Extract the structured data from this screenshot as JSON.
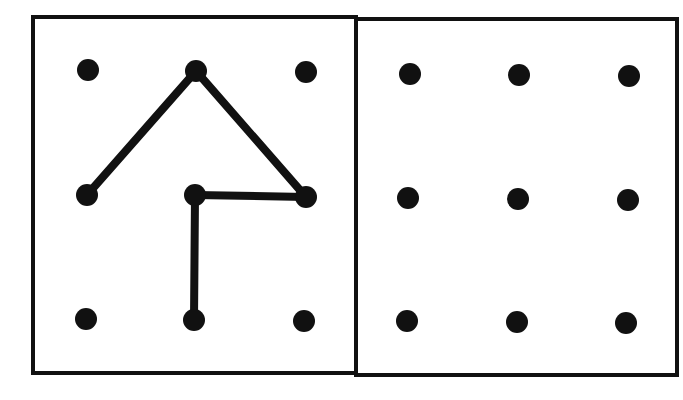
{
  "diagram": {
    "type": "dot-grid-puzzle",
    "colors": {
      "background": "#ffffff",
      "ink": "#111111"
    },
    "panels": [
      {
        "id": "left",
        "label": "pattern",
        "frame": {
          "x": 33,
          "y": 17,
          "w": 323,
          "h": 356
        },
        "grid": {
          "rows": 3,
          "cols": 3,
          "dots": [
            [
              88,
              70
            ],
            [
              196,
              71
            ],
            [
              306,
              72
            ],
            [
              87,
              195
            ],
            [
              195,
              195
            ],
            [
              306,
              197
            ],
            [
              86,
              319
            ],
            [
              194,
              320
            ],
            [
              304,
              321
            ]
          ]
        },
        "segments": [
          {
            "from": [
              87,
              195
            ],
            "to": [
              196,
              71
            ]
          },
          {
            "from": [
              196,
              71
            ],
            "to": [
              306,
              197
            ]
          },
          {
            "from": [
              306,
              197
            ],
            "to": [
              195,
              195
            ]
          },
          {
            "from": [
              195,
              195
            ],
            "to": [
              194,
              320
            ]
          }
        ]
      },
      {
        "id": "right",
        "label": "blank-grid",
        "frame": {
          "x": 356,
          "y": 19,
          "w": 321,
          "h": 356
        },
        "grid": {
          "rows": 3,
          "cols": 3,
          "dots": [
            [
              410,
              74
            ],
            [
              519,
              75
            ],
            [
              629,
              76
            ],
            [
              408,
              198
            ],
            [
              518,
              199
            ],
            [
              628,
              200
            ],
            [
              407,
              321
            ],
            [
              517,
              322
            ],
            [
              626,
              323
            ]
          ]
        },
        "segments": []
      }
    ],
    "dot_radius": 11,
    "line_width": 8,
    "frame_width": 4
  }
}
